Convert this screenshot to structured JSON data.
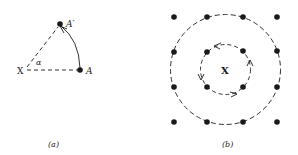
{
  "figure_a": {
    "caption": "(a)",
    "center_label": "X",
    "angle_label": "α",
    "point_start_label": "A",
    "point_end_label": "A′"
  },
  "figure_b": {
    "caption": "(b)",
    "center_label": "X",
    "rotation": "counterclockwise",
    "lattice_rows": 4,
    "lattice_cols": 4
  },
  "colors": {
    "ink": "#1a1a1a",
    "background": "#ffffff"
  }
}
